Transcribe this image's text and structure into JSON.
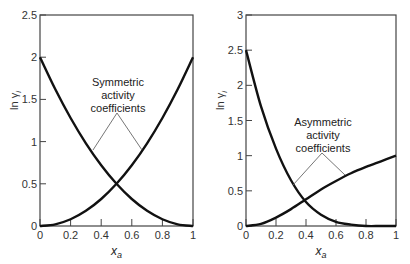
{
  "chart_data": [
    {
      "type": "line",
      "title": "",
      "xlabel": "x_a",
      "ylabel": "ln γ_i",
      "xlim": [
        0,
        1
      ],
      "ylim": [
        0,
        2.5
      ],
      "xticks": [
        "0",
        "0.2",
        "0.4",
        "0.6",
        "0.8",
        "1"
      ],
      "yticks": [
        "0",
        "0.5",
        "1",
        "1.5",
        "2",
        "2.5"
      ],
      "grid": false,
      "annotation": [
        "Symmetric",
        "activity",
        "coefficients"
      ],
      "x": [
        0,
        0.1,
        0.2,
        0.3,
        0.4,
        0.5,
        0.6,
        0.7,
        0.8,
        0.9,
        1.0
      ],
      "series": [
        {
          "name": "ln γ_a",
          "values": [
            2.0,
            1.62,
            1.28,
            0.98,
            0.72,
            0.5,
            0.32,
            0.18,
            0.08,
            0.02,
            0.0
          ]
        },
        {
          "name": "ln γ_b",
          "values": [
            0.0,
            0.02,
            0.08,
            0.18,
            0.32,
            0.5,
            0.72,
            0.98,
            1.28,
            1.62,
            2.0
          ]
        }
      ]
    },
    {
      "type": "line",
      "title": "",
      "xlabel": "x_a",
      "ylabel": "ln γ_i",
      "xlim": [
        0,
        1
      ],
      "ylim": [
        0,
        3
      ],
      "xticks": [
        "0",
        "0.2",
        "0.4",
        "0.6",
        "0.8",
        "1"
      ],
      "yticks": [
        "0",
        "0.5",
        "1",
        "1.5",
        "2",
        "2.5",
        "3"
      ],
      "grid": false,
      "annotation": [
        "Asymmetric",
        "activity",
        "coefficients"
      ],
      "x": [
        0,
        0.1,
        0.2,
        0.3,
        0.4,
        0.5,
        0.6,
        0.7,
        0.8,
        0.9,
        1.0
      ],
      "series": [
        {
          "name": "ln γ_a",
          "values": [
            2.5,
            1.7,
            1.1,
            0.65,
            0.34,
            0.16,
            0.06,
            0.02,
            0.0,
            0.0,
            0.0
          ]
        },
        {
          "name": "ln γ_b",
          "values": [
            0.0,
            0.03,
            0.12,
            0.24,
            0.38,
            0.52,
            0.64,
            0.75,
            0.84,
            0.92,
            1.0
          ]
        }
      ]
    }
  ]
}
